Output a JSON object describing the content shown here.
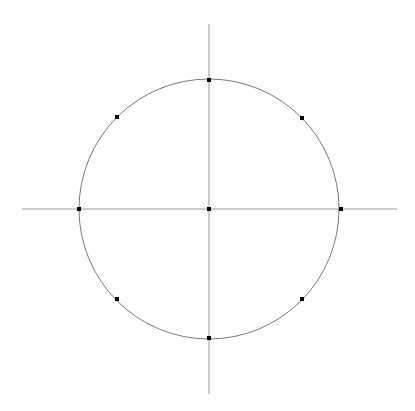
{
  "diagram": {
    "type": "unit-circle-with-axes",
    "background": "#ffffff",
    "canvas": {
      "width": 415,
      "height": 411
    },
    "center": {
      "x": 209,
      "y": 209
    },
    "radius": 130,
    "axes": {
      "horizontal": {
        "x1": 22,
        "y1": 209,
        "x2": 397,
        "y2": 209
      },
      "vertical": {
        "x1": 209,
        "y1": 24,
        "x2": 209,
        "y2": 394
      },
      "stroke": "#9a9a9a",
      "stroke_width": 1
    },
    "circle": {
      "stroke": "#7a7a7a",
      "stroke_width": 1
    },
    "points": [
      {
        "name": "center",
        "x": 209,
        "y": 209
      },
      {
        "name": "angle-0",
        "angle_deg": 0,
        "x": 341,
        "y": 209
      },
      {
        "name": "angle-45",
        "angle_deg": 45,
        "x": 302,
        "y": 118
      },
      {
        "name": "angle-90",
        "angle_deg": 90,
        "x": 209,
        "y": 80
      },
      {
        "name": "angle-135",
        "angle_deg": 135,
        "x": 117,
        "y": 117
      },
      {
        "name": "angle-180",
        "angle_deg": 180,
        "x": 79,
        "y": 209
      },
      {
        "name": "angle-225",
        "angle_deg": 225,
        "x": 117,
        "y": 299
      },
      {
        "name": "angle-270",
        "angle_deg": 270,
        "x": 209,
        "y": 338
      },
      {
        "name": "angle-315",
        "angle_deg": 315,
        "x": 302,
        "y": 299
      }
    ],
    "point_color": "#000000",
    "point_size": 4
  }
}
